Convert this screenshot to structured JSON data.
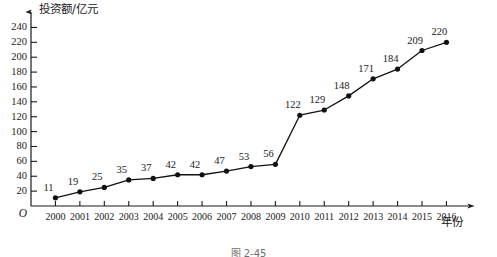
{
  "chart_data": {
    "type": "line",
    "title": "",
    "xlabel": "年份",
    "ylabel": "投资额/亿元",
    "categories": [
      "2000",
      "2001",
      "2002",
      "2003",
      "2004",
      "2005",
      "2006",
      "2007",
      "2008",
      "2009",
      "2010",
      "2011",
      "2012",
      "2013",
      "2014",
      "2015",
      "2016"
    ],
    "values": [
      11,
      19,
      25,
      35,
      37,
      42,
      42,
      47,
      53,
      56,
      122,
      129,
      148,
      171,
      184,
      209,
      220
    ],
    "ylim": [
      0,
      250
    ],
    "yticks": [
      20,
      40,
      60,
      80,
      100,
      120,
      140,
      160,
      180,
      200,
      220,
      240
    ],
    "ytick_labels": [
      "20",
      "40",
      "60",
      "80",
      "100",
      "120",
      "140",
      "160",
      "180",
      "200",
      "220",
      "240"
    ],
    "grid": false,
    "legend": null,
    "origin_label": "O",
    "data_labels_shown": true,
    "line_color": "#111111",
    "marker_color": "#111111",
    "marker": "filled-circle"
  },
  "figure": {
    "caption": "图 2-45"
  }
}
